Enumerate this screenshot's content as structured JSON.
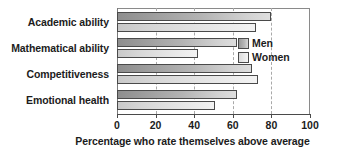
{
  "chart_data": {
    "type": "bar",
    "orientation": "horizontal",
    "title": "",
    "xlabel": "Percentage who rate themselves above average",
    "ylabel": "",
    "xlim": [
      0,
      100
    ],
    "xticks": [
      0,
      20,
      40,
      60,
      80,
      100
    ],
    "xtick_labels": [
      "0",
      "20",
      "40",
      "60",
      "80",
      "100"
    ],
    "grid": true,
    "legend_position": "inside-right",
    "categories": [
      "Academic ability",
      "Mathematical ability",
      "Competitiveness",
      "Emotional health"
    ],
    "series": [
      {
        "name": "Men",
        "color": "#b4b4b4",
        "values": [
          80,
          62,
          70,
          62
        ]
      },
      {
        "name": "Women",
        "color": "#e4e4e4",
        "values": [
          72,
          42,
          73,
          51
        ]
      }
    ]
  },
  "legend": {
    "items": [
      {
        "label": "Men"
      },
      {
        "label": "Women"
      }
    ]
  },
  "axis": {
    "x_title": "Percentage who rate themselves above average"
  }
}
